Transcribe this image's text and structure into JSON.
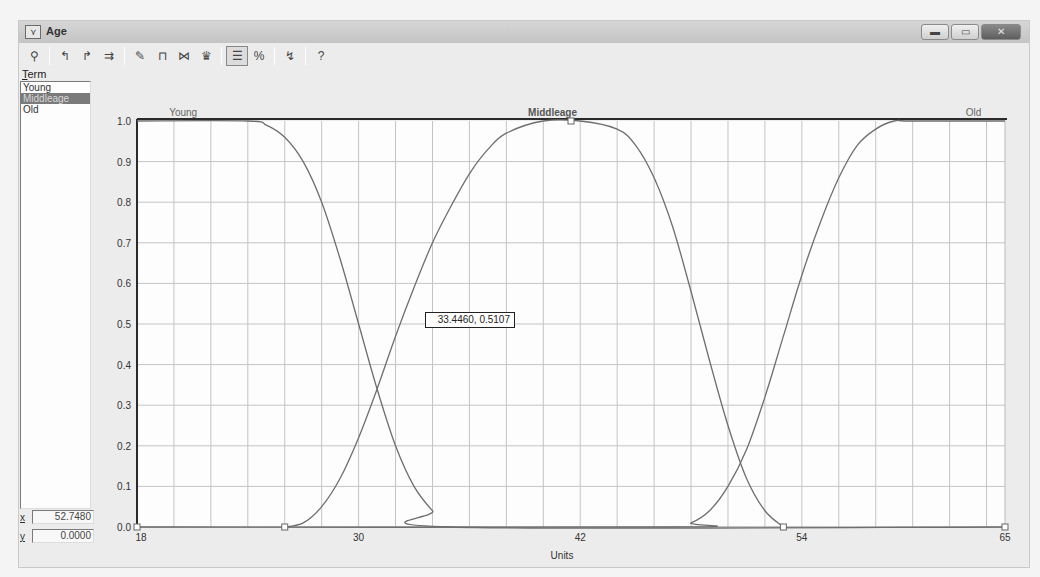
{
  "window": {
    "title": "Age",
    "icon": "membership-function-icon",
    "controls": [
      {
        "name": "minimize-button",
        "glyph": "▬"
      },
      {
        "name": "maximize-button",
        "glyph": "▭"
      },
      {
        "name": "close-button",
        "glyph": "✕"
      }
    ]
  },
  "toolbar": {
    "groups": [
      [
        {
          "name": "select-term-icon",
          "glyph": "⚲"
        }
      ],
      [
        {
          "name": "left-shoulder-icon",
          "glyph": "↰"
        },
        {
          "name": "right-shoulder-icon",
          "glyph": "↱"
        },
        {
          "name": "spread-icon",
          "glyph": "⇉"
        }
      ],
      [
        {
          "name": "add-term-icon",
          "glyph": "✎"
        },
        {
          "name": "trapezoid-icon",
          "glyph": "⊓"
        },
        {
          "name": "pi-shape-icon",
          "glyph": "⋈"
        },
        {
          "name": "delete-term-icon",
          "glyph": "♛"
        }
      ],
      [
        {
          "name": "properties-icon",
          "glyph": "☰",
          "pressed": true
        },
        {
          "name": "percent-icon",
          "glyph": "%"
        }
      ],
      [
        {
          "name": "plot-icon",
          "glyph": "↯"
        }
      ],
      [
        {
          "name": "help-icon",
          "glyph": "?"
        }
      ]
    ]
  },
  "term_panel": {
    "label_prefix": "T",
    "label_rest": "erm",
    "items": [
      "Young",
      "Middleage",
      "Old"
    ],
    "selected_index": 1,
    "x_label": "x",
    "x_value": "52.7480",
    "y_label": "y",
    "y_value": "0.0000"
  },
  "cursor_readout": "33.4460, 0.5107",
  "colors": {
    "curve": "#6e6e6e",
    "grid": "#c4c4c4",
    "axis": "#2a2a2a",
    "selected_term_bg": "#7a7a7a"
  },
  "chart_data": {
    "type": "line",
    "title": "",
    "xlabel": "Units",
    "ylabel": "",
    "xlim": [
      18,
      65
    ],
    "ylim": [
      0,
      1
    ],
    "x_ticks": [
      18,
      30,
      42,
      54,
      65
    ],
    "y_ticks": [
      "0.0",
      "0.1",
      "0.2",
      "0.3",
      "0.4",
      "0.5",
      "0.6",
      "0.7",
      "0.8",
      "0.9",
      "1.0"
    ],
    "grid": true,
    "x_grid_step": 2,
    "term_labels": [
      {
        "text": "Young",
        "x": 20.5,
        "bold": false
      },
      {
        "text": "Middleage",
        "x": 40.5,
        "bold": true
      },
      {
        "text": "Old",
        "x": 63.3,
        "bold": false
      }
    ],
    "series": [
      {
        "name": "Young",
        "shape": "Z (left shoulder)",
        "x": [
          18,
          24,
          25,
          26,
          27,
          28,
          29,
          30,
          31,
          32,
          33,
          34,
          35,
          65
        ],
        "values": [
          1.0,
          1.0,
          0.99,
          0.96,
          0.9,
          0.8,
          0.66,
          0.5,
          0.34,
          0.2,
          0.1,
          0.04,
          0.0,
          0.0
        ]
      },
      {
        "name": "Middleage",
        "shape": "Pi (bell)",
        "x": [
          26,
          27,
          28,
          29,
          30,
          31,
          32,
          33,
          34,
          35,
          36,
          37,
          38,
          40,
          42,
          44,
          45,
          46,
          47,
          48,
          49,
          50,
          51,
          52,
          53
        ],
        "values": [
          0.0,
          0.01,
          0.05,
          0.12,
          0.22,
          0.34,
          0.47,
          0.59,
          0.7,
          0.79,
          0.87,
          0.93,
          0.97,
          1.0,
          1.0,
          0.98,
          0.94,
          0.86,
          0.74,
          0.58,
          0.41,
          0.25,
          0.12,
          0.04,
          0.0
        ]
      },
      {
        "name": "Old",
        "shape": "S (right shoulder)",
        "x": [
          18,
          47,
          48,
          49,
          50,
          51,
          52,
          53,
          54,
          55,
          56,
          57,
          58,
          59,
          60,
          65
        ],
        "values": [
          0.0,
          0.0,
          0.01,
          0.04,
          0.1,
          0.19,
          0.32,
          0.47,
          0.62,
          0.75,
          0.86,
          0.94,
          0.98,
          1.0,
          1.0,
          1.0
        ]
      }
    ],
    "handles": [
      {
        "x": 18,
        "y": 0
      },
      {
        "x": 26,
        "y": 0
      },
      {
        "x": 41.5,
        "y": 1
      },
      {
        "x": 53,
        "y": 0
      },
      {
        "x": 65,
        "y": 0
      }
    ]
  }
}
